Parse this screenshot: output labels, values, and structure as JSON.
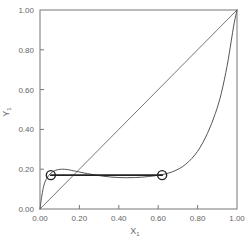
{
  "chart_data": {
    "type": "line",
    "title": "",
    "xlabel": "X",
    "xlabel_sub": "1",
    "ylabel": "Y",
    "ylabel_sub": "1",
    "xlim": [
      0,
      1
    ],
    "ylim": [
      0,
      1
    ],
    "grid": false,
    "legend": null,
    "x_ticks": [
      "0.00",
      "0.20",
      "0.40",
      "0.60",
      "0.80",
      "1.00"
    ],
    "y_ticks": [
      "0.00",
      "0.20",
      "0.40",
      "0.60",
      "0.80",
      "1.00"
    ],
    "series": [
      {
        "name": "diagonal",
        "x": [
          0,
          1
        ],
        "y": [
          0,
          1
        ]
      },
      {
        "name": "equilibrium-curve",
        "x": [
          0.0,
          0.01,
          0.02,
          0.035,
          0.055,
          0.08,
          0.11,
          0.14,
          0.18,
          0.24,
          0.32,
          0.4,
          0.48,
          0.55,
          0.62,
          0.68,
          0.74,
          0.8,
          0.85,
          0.89,
          0.92,
          0.95,
          0.97,
          0.985,
          1.0
        ],
        "y": [
          0.0,
          0.07,
          0.12,
          0.155,
          0.18,
          0.195,
          0.2,
          0.198,
          0.19,
          0.178,
          0.165,
          0.158,
          0.158,
          0.163,
          0.173,
          0.19,
          0.225,
          0.29,
          0.38,
          0.48,
          0.58,
          0.72,
          0.84,
          0.93,
          1.0
        ]
      },
      {
        "name": "tie-line",
        "x": [
          0.055,
          0.62
        ],
        "y": [
          0.17,
          0.17
        ]
      }
    ],
    "markers": [
      {
        "name": "left-phase-point",
        "x": 0.055,
        "y": 0.17,
        "shape": "open-circle"
      },
      {
        "name": "right-phase-point",
        "x": 0.62,
        "y": 0.17,
        "shape": "open-circle"
      }
    ],
    "layout": {
      "plot_left": 40,
      "plot_right": 237,
      "plot_top": 10,
      "plot_bottom": 209
    },
    "colors": {
      "axis": "#777777",
      "curve": "#555555",
      "diagonal": "#666666",
      "tie_line": "#222222",
      "marker": "#222222",
      "text": "#666666"
    }
  }
}
